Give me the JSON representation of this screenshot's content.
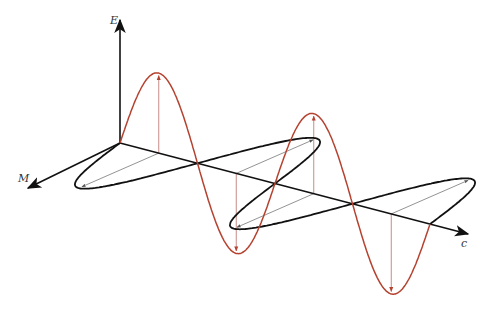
{
  "diagram": {
    "labels": {
      "electric_axis": "E",
      "magnetic_axis": "M",
      "propagation_axis": "c"
    },
    "colors": {
      "electric_wave": "#b5412f",
      "electric_vectors": "#c98b84",
      "magnetic_wave": "#111111",
      "magnetic_vectors": "#777777",
      "axes": "#111111"
    },
    "geometry": {
      "origin": [
        120,
        143
      ],
      "propagation_end": [
        468,
        234
      ],
      "electric_axis_end": [
        120,
        20
      ],
      "magnetic_axis_end": [
        28,
        188
      ],
      "wavelength_px": 155,
      "electric_amplitude": 80,
      "magnetic_vector": [
        -80,
        35
      ],
      "periods": 2
    }
  }
}
